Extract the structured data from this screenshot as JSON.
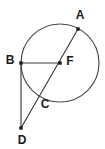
{
  "diagram": {
    "background_color": "#ffffff",
    "stroke_color": "#3a3a3a",
    "label_color": "#1a1a1a",
    "circle": {
      "center_label": "F",
      "center_x": 60,
      "center_y": 63,
      "radius": 39
    },
    "points": [
      {
        "id": "A",
        "label": "A",
        "x": 78,
        "y": 29,
        "label_x": 80,
        "label_y": 16,
        "on_circle": true,
        "dot": true
      },
      {
        "id": "B",
        "label": "B",
        "x": 21,
        "y": 63,
        "label_x": 10,
        "label_y": 61,
        "on_circle": true,
        "dot": true
      },
      {
        "id": "F",
        "label": "F",
        "x": 60,
        "y": 63,
        "label_x": 70,
        "label_y": 62,
        "on_circle": false,
        "dot": true
      },
      {
        "id": "C",
        "label": "C",
        "x": 40,
        "y": 95,
        "label_x": 45,
        "label_y": 105,
        "on_circle": true,
        "dot": false
      },
      {
        "id": "D",
        "label": "D",
        "x": 21,
        "y": 128,
        "label_x": 22,
        "label_y": 141,
        "on_circle": false,
        "dot": true
      }
    ],
    "segments": [
      {
        "id": "AD",
        "label": "A to D",
        "x1": 78,
        "y1": 29,
        "x2": 21,
        "y2": 128
      },
      {
        "id": "BF",
        "label": "B to F",
        "x1": 21,
        "y1": 63,
        "x2": 60,
        "y2": 63
      },
      {
        "id": "BD",
        "label": "B to D",
        "x1": 21,
        "y1": 63,
        "x2": 21,
        "y2": 128
      }
    ]
  }
}
